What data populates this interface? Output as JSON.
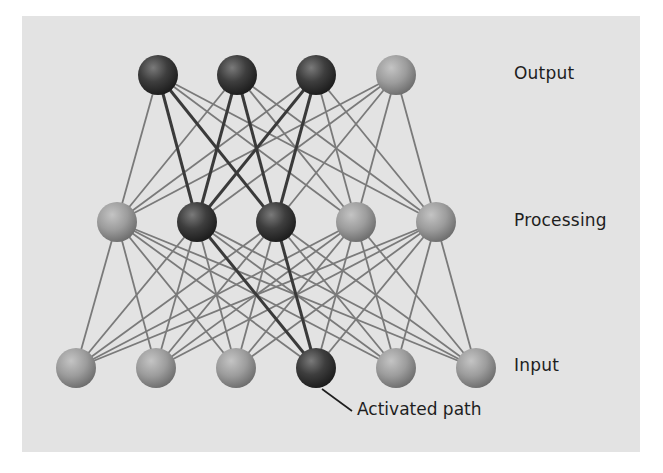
{
  "diagram": {
    "colors": {
      "background_panel": "#e3e3e3",
      "edge": "#7a7a7a",
      "edge_active": "#3a3a3a",
      "node_light": "#9a9a9a",
      "node_dark": "#3b3b3b"
    },
    "layers": [
      {
        "name": "Output",
        "label": "Output",
        "label_pos": [
          514,
          75
        ],
        "y": 75,
        "nodes": [
          {
            "x": 158,
            "active": true
          },
          {
            "x": 237,
            "active": true
          },
          {
            "x": 316,
            "active": true
          },
          {
            "x": 396,
            "active": false
          }
        ]
      },
      {
        "name": "Processing",
        "label": "Processing",
        "label_pos": [
          514,
          222
        ],
        "y": 222,
        "nodes": [
          {
            "x": 117,
            "active": false
          },
          {
            "x": 197,
            "active": true
          },
          {
            "x": 276,
            "active": true
          },
          {
            "x": 356,
            "active": false
          },
          {
            "x": 436,
            "active": false
          }
        ]
      },
      {
        "name": "Input",
        "label": "Input",
        "label_pos": [
          514,
          367
        ],
        "y": 368,
        "nodes": [
          {
            "x": 76,
            "active": false
          },
          {
            "x": 156,
            "active": false
          },
          {
            "x": 236,
            "active": false
          },
          {
            "x": 316,
            "active": true
          },
          {
            "x": 396,
            "active": false
          },
          {
            "x": 476,
            "active": false
          }
        ]
      }
    ],
    "node_radius": 20,
    "callout": {
      "label": "Activated path",
      "line": [
        [
          322,
          389
        ],
        [
          352,
          411
        ]
      ],
      "label_pos": [
        357,
        411
      ]
    }
  }
}
